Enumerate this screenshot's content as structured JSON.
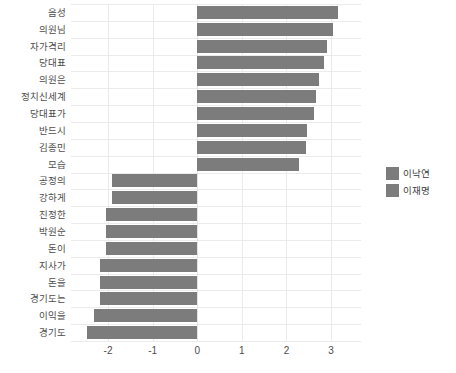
{
  "chart_data": {
    "type": "bar",
    "orientation": "horizontal",
    "title": "",
    "xlabel": "",
    "ylabel": "",
    "xlim": [
      -2.83,
      3.67
    ],
    "xticks": [
      -2,
      -1,
      0,
      1,
      2,
      3
    ],
    "xticklabels": [
      "-2",
      "-1",
      "0",
      "1",
      "2",
      "3"
    ],
    "grid": true,
    "legend_position": "right",
    "bar_color": "#7c7c7c",
    "grid_color": "#ebebeb",
    "background": "#ffffff",
    "categories": [
      "음성",
      "의원님",
      "자가격리",
      "당대표",
      "의원은",
      "정치신세계",
      "당대표가",
      "반드시",
      "김종민",
      "모습",
      "공정의",
      "강하게",
      "진정한",
      "박원순",
      "돈이",
      "지사가",
      "돈을",
      "경기도는",
      "이익을",
      "경기도"
    ],
    "values": [
      3.15,
      3.05,
      2.9,
      2.85,
      2.72,
      2.67,
      2.62,
      2.47,
      2.43,
      2.28,
      -1.92,
      -1.92,
      -2.05,
      -2.05,
      -2.05,
      -2.18,
      -2.18,
      -2.18,
      -2.32,
      -2.47
    ],
    "legend": [
      {
        "label": "이낙연",
        "color": "#7c7c7c"
      },
      {
        "label": "이재명",
        "color": "#7c7c7c"
      }
    ]
  }
}
